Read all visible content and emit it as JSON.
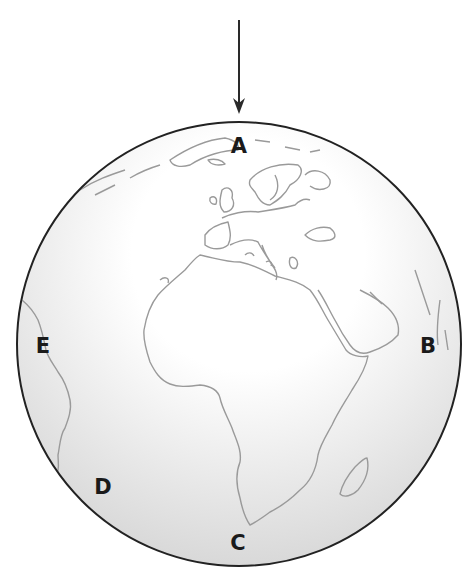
{
  "diagram": {
    "type": "globe-illustration",
    "arrow": {
      "x": 239,
      "y_start": 20,
      "y_end": 112,
      "color": "#2a2a2a"
    },
    "globe": {
      "cx": 239,
      "cy": 344,
      "r": 222,
      "outline_color": "#222222",
      "coastline_color": "#9a9a9a",
      "shade_light": "#ffffff",
      "shade_dark": "#d6d6d6"
    },
    "labels": [
      {
        "id": "A",
        "text": "A",
        "x": 239,
        "y": 146
      },
      {
        "id": "B",
        "text": "B",
        "x": 428,
        "y": 346
      },
      {
        "id": "C",
        "text": "C",
        "x": 238,
        "y": 543
      },
      {
        "id": "D",
        "text": "D",
        "x": 103,
        "y": 487
      },
      {
        "id": "E",
        "text": "E",
        "x": 43,
        "y": 346
      }
    ],
    "continents": [
      "Europe",
      "Africa",
      "Madagascar",
      "Arabian Peninsula",
      "Greenland",
      "South America (edge)",
      "India (edge)"
    ]
  }
}
